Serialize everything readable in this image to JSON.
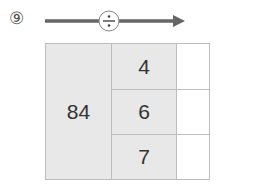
{
  "problem": {
    "number": "⑨",
    "operator": "÷",
    "operator_icon": "divide-icon",
    "dividend": "84",
    "divisors": [
      "4",
      "6",
      "7"
    ],
    "answers": [
      "",
      "",
      ""
    ]
  },
  "colors": {
    "arrow": "#666666",
    "shaded_cell": "#e8e8e8",
    "border": "#bdbdbd"
  }
}
